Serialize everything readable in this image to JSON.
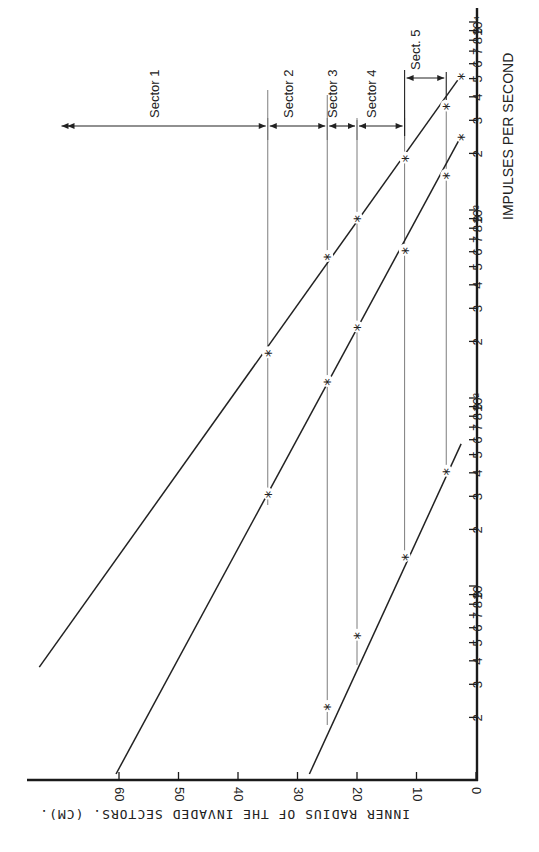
{
  "chart_data": {
    "type": "line",
    "orientation": "rotated 90 degrees clockwise on page (x-axis runs vertically on right edge, y-axis runs horizontally along bottom edge, both labels read rotated)",
    "title": "",
    "xlabel": "IMPULSES PER SECOND",
    "ylabel": "INNER RADIUS OF THE INVADED SECTORS. (CM).",
    "x_scale": "log",
    "xlim": [
      1,
      10000
    ],
    "ylim": [
      0,
      70
    ],
    "x_tick_labels": [
      "2",
      "3",
      "4",
      "5",
      "6",
      "7",
      "8",
      "9",
      "10",
      "2",
      "3",
      "4",
      "5",
      "6",
      "7",
      "8",
      "9",
      "10²",
      "2",
      "3",
      "4",
      "5",
      "6",
      "7",
      "8",
      "9",
      "10³",
      "2",
      "3",
      "4",
      "5",
      "6",
      "7",
      "8",
      "9",
      "10⁴"
    ],
    "y_ticks": [
      0,
      10,
      20,
      30,
      40,
      50,
      60
    ],
    "grid": false,
    "reference_radii": [
      35,
      25,
      20,
      12,
      5
    ],
    "sectors": [
      {
        "label": "Sector 1",
        "from": 35,
        "to": 70
      },
      {
        "label": "Sector 2",
        "from": 25,
        "to": 35
      },
      {
        "label": "Sector 3",
        "from": 20,
        "to": 25
      },
      {
        "label": "Sector 4",
        "from": 12,
        "to": 20
      },
      {
        "label": "Sect. 5",
        "from": 5,
        "to": 12
      }
    ],
    "series": [
      {
        "name": "Line A (upper)",
        "line": [
          {
            "x": 3.7,
            "y": 73.4
          },
          {
            "x": 5200,
            "y": 2.5
          }
        ],
        "points": [
          {
            "x": 175,
            "y": 35
          },
          {
            "x": 570,
            "y": 25
          },
          {
            "x": 910,
            "y": 20
          },
          {
            "x": 1900,
            "y": 12
          },
          {
            "x": 3600,
            "y": 5
          },
          {
            "x": 5200,
            "y": 2.5
          }
        ]
      },
      {
        "name": "Line B (middle)",
        "line": [
          {
            "x": 1,
            "y": 60.5
          },
          {
            "x": 2470,
            "y": 2.5
          }
        ],
        "points": [
          {
            "x": 31,
            "y": 35
          },
          {
            "x": 123,
            "y": 25
          },
          {
            "x": 240,
            "y": 20
          },
          {
            "x": 615,
            "y": 12
          },
          {
            "x": 1540,
            "y": 5
          },
          {
            "x": 2470,
            "y": 2.5
          }
        ]
      },
      {
        "name": "Line C (lower)",
        "line": [
          {
            "x": 1,
            "y": 28
          },
          {
            "x": 57,
            "y": 2.5
          }
        ],
        "points": [
          {
            "x": 2.3,
            "y": 25
          },
          {
            "x": 5.5,
            "y": 20
          },
          {
            "x": 14.4,
            "y": 12
          },
          {
            "x": 41,
            "y": 5
          }
        ]
      }
    ]
  },
  "labels": {
    "xlabel": "IMPULSES PER SECOND",
    "ylabel": "INNER RADIUS OF THE INVADED SECTORS. (CM).",
    "marker": "*"
  },
  "colors": {
    "ink": "#222222",
    "reference_line": "#6e6e6e",
    "background": "#ffffff"
  }
}
